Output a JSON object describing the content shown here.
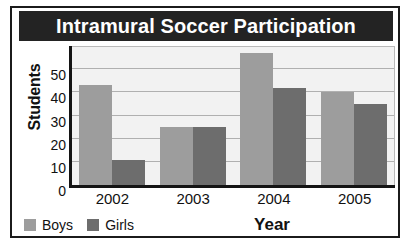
{
  "chart_data": {
    "type": "bar",
    "title": "Intramural Soccer Participation",
    "xlabel": "Year",
    "ylabel": "Students",
    "categories": [
      "2002",
      "2003",
      "2004",
      "2005"
    ],
    "series": [
      {
        "name": "Boys",
        "color": "#9d9d9d",
        "values": [
          43,
          25,
          57,
          40
        ]
      },
      {
        "name": "Girls",
        "color": "#6d6d6d",
        "values": [
          11,
          25,
          42,
          35
        ]
      }
    ],
    "ylim": [
      0,
      60
    ],
    "yticks": [
      50,
      40,
      30,
      20,
      10,
      0
    ],
    "ytick_values": [
      50,
      40,
      30,
      20,
      10,
      0
    ],
    "gridlines": [
      10,
      20,
      30,
      40,
      50
    ],
    "grid": true,
    "legend_position": "bottom-left",
    "title_background": "#232323",
    "title_color": "#ffffff",
    "plot_background": "#f2f2f2"
  }
}
